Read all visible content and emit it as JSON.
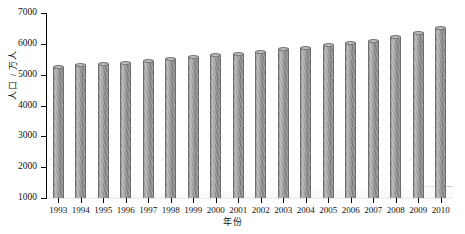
{
  "chart_data": {
    "type": "bar",
    "title": "",
    "xlabel": "年份",
    "ylabel": "人口 / 万人",
    "categories": [
      "1993",
      "1994",
      "1995",
      "1996",
      "1997",
      "1998",
      "1999",
      "2000",
      "2001",
      "2002",
      "2003",
      "2004",
      "2005",
      "2006",
      "2007",
      "2008",
      "2009",
      "2010"
    ],
    "values": [
      5250,
      5300,
      5340,
      5390,
      5450,
      5510,
      5570,
      5630,
      5680,
      5750,
      5820,
      5880,
      5950,
      6020,
      6100,
      6220,
      6340,
      6500
    ],
    "ylim": [
      1000,
      7000
    ],
    "yticks": [
      1000,
      2000,
      3000,
      4000,
      5000,
      6000,
      7000
    ],
    "ytick_labels": [
      "1000",
      "2000",
      "3000",
      "4000",
      "5000",
      "6000",
      "7000"
    ],
    "grid": false,
    "legend": null,
    "series_color": "#8f8f8f",
    "axis_color": "#000000",
    "bar_style": "3d-cylinder"
  }
}
